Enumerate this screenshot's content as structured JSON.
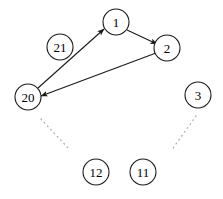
{
  "diagram": {
    "background_color": "#ffffff",
    "stroke_color": "#1a1a1a",
    "dotted_color": "#b0b0b0",
    "width": 223,
    "height": 199,
    "nodes": [
      {
        "id": "1",
        "label": "1",
        "cx": 116,
        "cy": 22,
        "r": 13
      },
      {
        "id": "2",
        "label": "2",
        "cx": 167,
        "cy": 48,
        "r": 13
      },
      {
        "id": "21",
        "label": "21",
        "cx": 60,
        "cy": 47,
        "r": 13
      },
      {
        "id": "20",
        "label": "20",
        "cx": 28,
        "cy": 97,
        "r": 13
      },
      {
        "id": "3",
        "label": "3",
        "cx": 198,
        "cy": 95,
        "r": 13
      },
      {
        "id": "12",
        "label": "12",
        "cx": 96,
        "cy": 172,
        "r": 13
      },
      {
        "id": "11",
        "label": "11",
        "cx": 143,
        "cy": 172,
        "r": 13
      }
    ],
    "edges": [
      {
        "id": "edge-20-1",
        "from": "20",
        "to": "1",
        "x1": 38,
        "y1": 88,
        "x2": 104,
        "y2": 29,
        "arrow": true
      },
      {
        "id": "edge-1-2",
        "from": "1",
        "to": "2",
        "x1": 127,
        "y1": 30,
        "x2": 157,
        "y2": 44,
        "arrow": true
      },
      {
        "id": "edge-2-20",
        "from": "2",
        "to": "20",
        "x1": 156,
        "y1": 53,
        "x2": 41,
        "y2": 96,
        "arrow": true
      }
    ],
    "dotted_edges": [
      {
        "id": "dotted-left",
        "x1": 41,
        "y1": 119,
        "x2": 70,
        "y2": 150
      },
      {
        "id": "dotted-right",
        "x1": 196,
        "y1": 116,
        "x2": 171,
        "y2": 151
      }
    ]
  }
}
